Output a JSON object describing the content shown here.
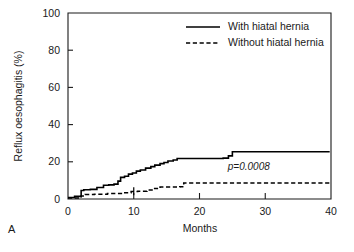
{
  "panel": {
    "label": "A"
  },
  "chart_data": {
    "type": "line",
    "title": "",
    "subtitle": "",
    "xlabel": "Months",
    "ylabel": "Reflux oesophagitis (%)",
    "xlim": [
      0,
      40
    ],
    "ylim": [
      0,
      100
    ],
    "xticks": [
      0,
      10,
      20,
      30,
      40
    ],
    "xtick_labels": [
      "0",
      "10",
      "20",
      "30",
      "40"
    ],
    "yticks": [
      0,
      20,
      40,
      60,
      80,
      100
    ],
    "ytick_labels": [
      "0",
      "20",
      "40",
      "60",
      "80",
      "100"
    ],
    "grid": false,
    "legend_position": "top-right",
    "annotations": [
      {
        "text": "p=0.0008",
        "x": 27.5,
        "y": 15.5,
        "style": "italic"
      }
    ],
    "series": [
      {
        "name": "With hiatal hernia",
        "style": "solid",
        "color": "#000000",
        "step": "post",
        "x": [
          0,
          0.6,
          1.0,
          1.8,
          2.0,
          2.4,
          3.4,
          4.4,
          5.4,
          6.2,
          7.0,
          7.6,
          8.0,
          8.6,
          9.2,
          9.8,
          10.4,
          11.0,
          11.8,
          12.6,
          13.2,
          14.0,
          14.6,
          15.2,
          16.0,
          16.6,
          23.6,
          24.4,
          25.0,
          39.8
        ],
        "y": [
          0.8,
          0.8,
          1.4,
          1.4,
          4.6,
          5.0,
          5.2,
          6.2,
          7.4,
          7.6,
          8.0,
          9.6,
          11.6,
          12.2,
          13.4,
          14.0,
          15.0,
          15.6,
          16.6,
          17.4,
          18.2,
          19.0,
          19.6,
          20.4,
          21.0,
          21.8,
          22.0,
          23.2,
          25.4,
          25.4
        ],
        "censor_marks": []
      },
      {
        "name": "Without hiatal hernia",
        "style": "dashed",
        "color": "#000000",
        "step": "post",
        "x": [
          0,
          1.4,
          2.0,
          2.6,
          4.0,
          6.0,
          8.4,
          9.6,
          10.6,
          12.0,
          13.0,
          14.0,
          17.0,
          17.6,
          39.8
        ],
        "y": [
          0.6,
          0.6,
          1.6,
          2.4,
          2.6,
          3.0,
          3.4,
          4.0,
          4.2,
          4.8,
          5.6,
          6.4,
          6.6,
          8.6,
          8.6
        ],
        "censor_marks": [
          {
            "x": 10.0,
            "y": 4.2
          }
        ]
      }
    ]
  }
}
